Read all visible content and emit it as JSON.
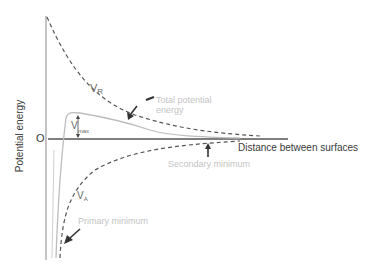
{
  "diagram": {
    "type": "DLVO potential energy diagram",
    "y_axis_label": "Potential energy",
    "x_axis_label": "Distance between surfaces",
    "origin_label": "O",
    "curves": {
      "repulsive": {
        "label_main": "V",
        "label_sub": "R",
        "style": "dashed"
      },
      "attractive": {
        "label_main": "V",
        "label_sub": "A",
        "style": "dashed"
      },
      "total": {
        "label": "Total potential energy",
        "line1": "Total potential",
        "line2": "energy",
        "style": "solid-gray"
      }
    },
    "annotations": {
      "vmax_main": "V",
      "vmax_sub": "max",
      "secondary_minimum": "Secondary minimum",
      "primary_minimum": "Primary minimum"
    },
    "colors": {
      "axis": "#555555",
      "dashed_curves": "#555555",
      "total_curve": "#bdbdbd",
      "light_text": "#c4c4c4",
      "dark_text": "#3a3a3a"
    }
  }
}
